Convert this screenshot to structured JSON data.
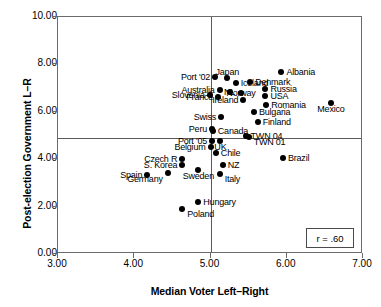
{
  "chart_data": {
    "type": "scatter",
    "title": "",
    "xlabel": "Median Voter Left–Right",
    "ylabel": "Post-election Government L–R",
    "xlim": [
      3.0,
      7.0
    ],
    "ylim": [
      0.0,
      10.0
    ],
    "xticks": [
      "3.00",
      "4.00",
      "5.00",
      "6.00",
      "7.00"
    ],
    "yticks": [
      "0.00",
      "2.00",
      "4.00",
      "6.00",
      "8.00",
      "10.00"
    ],
    "grid": false,
    "legend": "none",
    "annotations": [
      {
        "name": "correlation-box",
        "text": "r = .60"
      }
    ],
    "reference_lines": [
      {
        "orientation": "vertical",
        "value": 5.0
      },
      {
        "orientation": "horizontal",
        "value": 4.9
      }
    ],
    "points": [
      {
        "label": "Albania",
        "x": 5.93,
        "y": 7.68,
        "pos": "r"
      },
      {
        "label": "Japan",
        "x": 5.22,
        "y": 7.42,
        "pos": "ct"
      },
      {
        "label": "Port '02",
        "x": 5.06,
        "y": 7.45,
        "pos": "l"
      },
      {
        "label": "Iceland",
        "x": 5.33,
        "y": 7.22,
        "pos": "r"
      },
      {
        "label": "Denmark",
        "x": 5.52,
        "y": 7.25,
        "pos": "r"
      },
      {
        "label": "Russia",
        "x": 5.72,
        "y": 6.98,
        "pos": "r"
      },
      {
        "label": "Australia",
        "x": 5.12,
        "y": 6.92,
        "pos": "l"
      },
      {
        "label": "NL",
        "x": 5.25,
        "y": 6.82,
        "pos": "c"
      },
      {
        "label": "Norway",
        "x": 5.4,
        "y": 6.78,
        "pos": "c"
      },
      {
        "label": "USA",
        "x": 5.72,
        "y": 6.65,
        "pos": "r"
      },
      {
        "label": "Slovenia",
        "x": 4.99,
        "y": 6.7,
        "pos": "l"
      },
      {
        "label": "France",
        "x": 5.1,
        "y": 6.62,
        "pos": "l"
      },
      {
        "label": "Romania",
        "x": 5.73,
        "y": 6.28,
        "pos": "r"
      },
      {
        "label": "Mexico",
        "x": 6.58,
        "y": 6.38,
        "pos": "cb"
      },
      {
        "label": "Ireland",
        "x": 5.43,
        "y": 6.48,
        "pos": "l"
      },
      {
        "label": "Bulgaria",
        "x": 5.57,
        "y": 5.98,
        "pos": "r"
      },
      {
        "label": "Finland",
        "x": 5.62,
        "y": 5.58,
        "pos": "r"
      },
      {
        "label": "Swiss",
        "x": 5.14,
        "y": 5.78,
        "pos": "l"
      },
      {
        "label": "Peru",
        "x": 5.02,
        "y": 5.28,
        "pos": "l"
      },
      {
        "label": "Canada",
        "x": 5.03,
        "y": 5.18,
        "pos": "r"
      },
      {
        "label": "TWN 04",
        "x": 5.46,
        "y": 4.98,
        "pos": "r"
      },
      {
        "label": "TWN 01",
        "x": 5.5,
        "y": 4.92,
        "pos": "rb"
      },
      {
        "label": "Port '05",
        "x": 5.02,
        "y": 4.75,
        "pos": "l"
      },
      {
        "label": "UK",
        "x": 5.13,
        "y": 4.78,
        "pos": "cb"
      },
      {
        "label": "Belgium",
        "x": 5.0,
        "y": 4.52,
        "pos": "l"
      },
      {
        "label": "Chile",
        "x": 5.07,
        "y": 4.25,
        "pos": "r"
      },
      {
        "label": "Czech R",
        "x": 4.63,
        "y": 4.02,
        "pos": "l"
      },
      {
        "label": "Brazil",
        "x": 5.95,
        "y": 4.06,
        "pos": "r"
      },
      {
        "label": "S. Korea",
        "x": 4.63,
        "y": 3.76,
        "pos": "l"
      },
      {
        "label": "NZ",
        "x": 5.16,
        "y": 3.76,
        "pos": "r"
      },
      {
        "label": "Spain",
        "x": 4.17,
        "y": 3.34,
        "pos": "l"
      },
      {
        "label": "Germany",
        "x": 4.44,
        "y": 3.42,
        "pos": "lb"
      },
      {
        "label": "Sweden",
        "x": 4.84,
        "y": 3.56,
        "pos": "cb"
      },
      {
        "label": "Italy",
        "x": 5.12,
        "y": 3.38,
        "pos": "rb"
      },
      {
        "label": "Hungary",
        "x": 4.84,
        "y": 2.18,
        "pos": "r"
      },
      {
        "label": "Poland",
        "x": 4.63,
        "y": 1.88,
        "pos": "rb"
      }
    ]
  }
}
